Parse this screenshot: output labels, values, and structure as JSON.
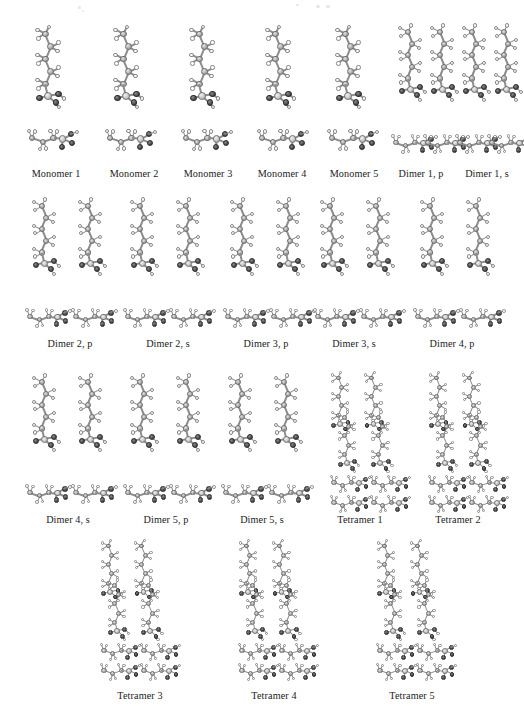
{
  "figure": {
    "kind": "molecular-structure-grid",
    "background_color": "#ffffff",
    "caption_color": "#1b1b1b",
    "atom_colors": {
      "carbon": "#bdbdbd",
      "hydrogen": "#fbfbfb",
      "oxygen": "#3c3c3c",
      "silicon": "#d2d2d2",
      "bond": "#8d8d8d"
    },
    "rows": [
      {
        "name": "monomers-row",
        "y": 22,
        "caption_y": 168,
        "panels": [
          {
            "label": "Monomer 1",
            "type": "monomer",
            "chains": 1,
            "x": 18,
            "width": 76,
            "caption_x": 18,
            "caption_w": 76
          },
          {
            "label": "Monomer 2",
            "type": "monomer",
            "chains": 1,
            "x": 96,
            "width": 76,
            "caption_x": 96,
            "caption_w": 76
          },
          {
            "label": "Monomer 3",
            "type": "monomer",
            "chains": 1,
            "x": 172,
            "width": 76,
            "caption_x": 170,
            "caption_w": 76
          },
          {
            "label": "Monomer 4",
            "type": "monomer",
            "chains": 1,
            "x": 248,
            "width": 76,
            "caption_x": 244,
            "caption_w": 76
          },
          {
            "label": "Monomer 5",
            "type": "monomer",
            "chains": 1,
            "x": 318,
            "width": 76,
            "caption_x": 316,
            "caption_w": 76
          },
          {
            "label": "Dimer 1, p",
            "type": "dimer",
            "chains": 2,
            "x": 388,
            "width": 62,
            "caption_x": 384,
            "caption_w": 74
          },
          {
            "label": "Dimer 1, s",
            "type": "dimer",
            "chains": 2,
            "x": 452,
            "width": 62,
            "caption_x": 450,
            "caption_w": 74
          }
        ]
      },
      {
        "name": "dimers-row-1",
        "y": 196,
        "caption_y": 338,
        "panels": [
          {
            "label": "Dimer 2, p",
            "type": "dimer",
            "chains": 2,
            "x": 22,
            "width": 96,
            "caption_x": 22,
            "caption_w": 96
          },
          {
            "label": "Dimer 2, s",
            "type": "dimer",
            "chains": 2,
            "x": 120,
            "width": 96,
            "caption_x": 120,
            "caption_w": 96
          },
          {
            "label": "Dimer 3, p",
            "type": "dimer",
            "chains": 2,
            "x": 220,
            "width": 96,
            "caption_x": 218,
            "caption_w": 96
          },
          {
            "label": "Dimer 3, s",
            "type": "dimer",
            "chains": 2,
            "x": 310,
            "width": 96,
            "caption_x": 306,
            "caption_w": 96
          },
          {
            "label": "Dimer 4, p",
            "type": "dimer",
            "chains": 2,
            "x": 410,
            "width": 96,
            "caption_x": 404,
            "caption_w": 96
          }
        ]
      },
      {
        "name": "dimers-tetramers-row",
        "y": 372,
        "caption_y": 514,
        "panels": [
          {
            "label": "Dimer 4, s",
            "type": "dimer",
            "chains": 2,
            "x": 22,
            "width": 96,
            "caption_x": 20,
            "caption_w": 96
          },
          {
            "label": "Dimer 5, p",
            "type": "dimer",
            "chains": 2,
            "x": 120,
            "width": 96,
            "caption_x": 118,
            "caption_w": 96
          },
          {
            "label": "Dimer 5, s",
            "type": "dimer",
            "chains": 2,
            "x": 218,
            "width": 96,
            "caption_x": 214,
            "caption_w": 96
          },
          {
            "label": "Tetramer 1",
            "type": "tetramer",
            "chains": 4,
            "x": 326,
            "width": 84,
            "caption_x": 312,
            "caption_w": 96
          },
          {
            "label": "Tetramer 2",
            "type": "tetramer",
            "chains": 4,
            "x": 424,
            "width": 84,
            "caption_x": 410,
            "caption_w": 96
          }
        ]
      },
      {
        "name": "tetramers-row",
        "y": 540,
        "caption_y": 690,
        "panels": [
          {
            "label": "Tetramer 3",
            "type": "tetramer",
            "chains": 4,
            "x": 96,
            "width": 84,
            "caption_x": 92,
            "caption_w": 96
          },
          {
            "label": "Tetramer 4",
            "type": "tetramer",
            "chains": 4,
            "x": 234,
            "width": 84,
            "caption_x": 226,
            "caption_w": 96
          },
          {
            "label": "Tetramer 5",
            "type": "tetramer",
            "chains": 4,
            "x": 372,
            "width": 84,
            "caption_x": 364,
            "caption_w": 96
          }
        ]
      }
    ]
  }
}
